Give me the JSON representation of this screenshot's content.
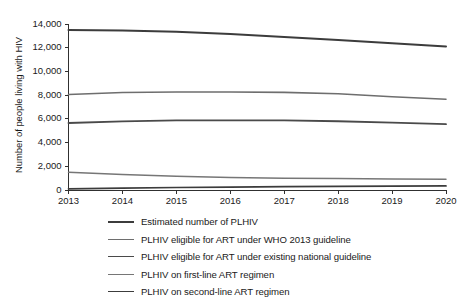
{
  "chart_data": {
    "type": "line",
    "title": "",
    "xlabel": "",
    "ylabel": "Number of people living with HIV",
    "x": [
      2013,
      2014,
      2015,
      2016,
      2017,
      2018,
      2019,
      2020
    ],
    "categories": [
      "2013",
      "2014",
      "2015",
      "2016",
      "2017",
      "2018",
      "2019",
      "2020"
    ],
    "xlim": [
      2013,
      2020
    ],
    "ylim": [
      0,
      14000
    ],
    "ytick_values": [
      0,
      2000,
      4000,
      6000,
      8000,
      10000,
      12000,
      14000
    ],
    "ytick_labels": [
      "0",
      "2,000",
      "4,000",
      "6,000",
      "8,000",
      "10,000",
      "12,000",
      "14,000"
    ],
    "grid": false,
    "legend_position": "below",
    "series": [
      {
        "name": "Estimated number of PLHIV",
        "color": "#3c3c3c",
        "width": 2.0,
        "values": [
          13500,
          13450,
          13350,
          13150,
          12900,
          12650,
          12380,
          12100
        ]
      },
      {
        "name": "PLHIV eligible for ART under WHO 2013 guideline",
        "color": "#6e6e6e",
        "width": 1.6,
        "values": [
          8050,
          8220,
          8270,
          8270,
          8230,
          8120,
          7870,
          7650
        ]
      },
      {
        "name": "PLHIV eligible for ART under existing national guideline",
        "color": "#4a4a4a",
        "width": 1.8,
        "values": [
          5650,
          5780,
          5870,
          5880,
          5870,
          5800,
          5680,
          5550
        ]
      },
      {
        "name": "PLHIV on first-line ART regimen",
        "color": "#767676",
        "width": 1.5,
        "values": [
          1500,
          1300,
          1150,
          1050,
          1000,
          960,
          930,
          900
        ]
      },
      {
        "name": "PLHIV on second-line ART regimen",
        "color": "#3c3c3c",
        "width": 1.7,
        "values": [
          100,
          160,
          210,
          250,
          280,
          305,
          325,
          345
        ]
      }
    ]
  },
  "legend": {
    "items": [
      {
        "label": "Estimated number of PLHIV"
      },
      {
        "label": "PLHIV eligible for ART under WHO 2013 guideline"
      },
      {
        "label": "PLHIV eligible for ART under existing national guideline"
      },
      {
        "label": "PLHIV on first-line ART regimen"
      },
      {
        "label": "PLHIV on second-line ART regimen"
      }
    ]
  }
}
